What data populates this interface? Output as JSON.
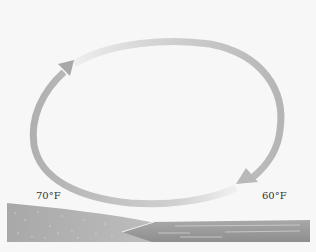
{
  "diagram": {
    "labels": {
      "land_temp": "70°F",
      "sea_temp": "60°F"
    },
    "colors": {
      "background": "#f7f7f7",
      "arrow": "#b5b5b5",
      "arrow_light": "#e6e6e6",
      "land": "#a6a6a6",
      "water": "#9a9a9a"
    }
  }
}
